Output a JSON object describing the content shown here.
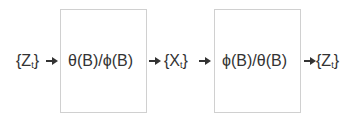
{
  "diagram": {
    "input": {
      "brace_open": "{",
      "symbol": "Z",
      "subscript": "t",
      "brace_close": "}"
    },
    "filter1": {
      "label": "θ(B)/ϕ(B)"
    },
    "middle": {
      "brace_open": "{",
      "symbol": "X",
      "subscript": "t",
      "brace_close": "}"
    },
    "filter2": {
      "label": "ϕ(B)/θ(B)"
    },
    "output": {
      "brace_open": "{",
      "symbol": "Z",
      "subscript": "t",
      "brace_close": "}"
    }
  },
  "colors": {
    "text": "#333333",
    "border": "#d0d0d0",
    "background": "#ffffff"
  }
}
